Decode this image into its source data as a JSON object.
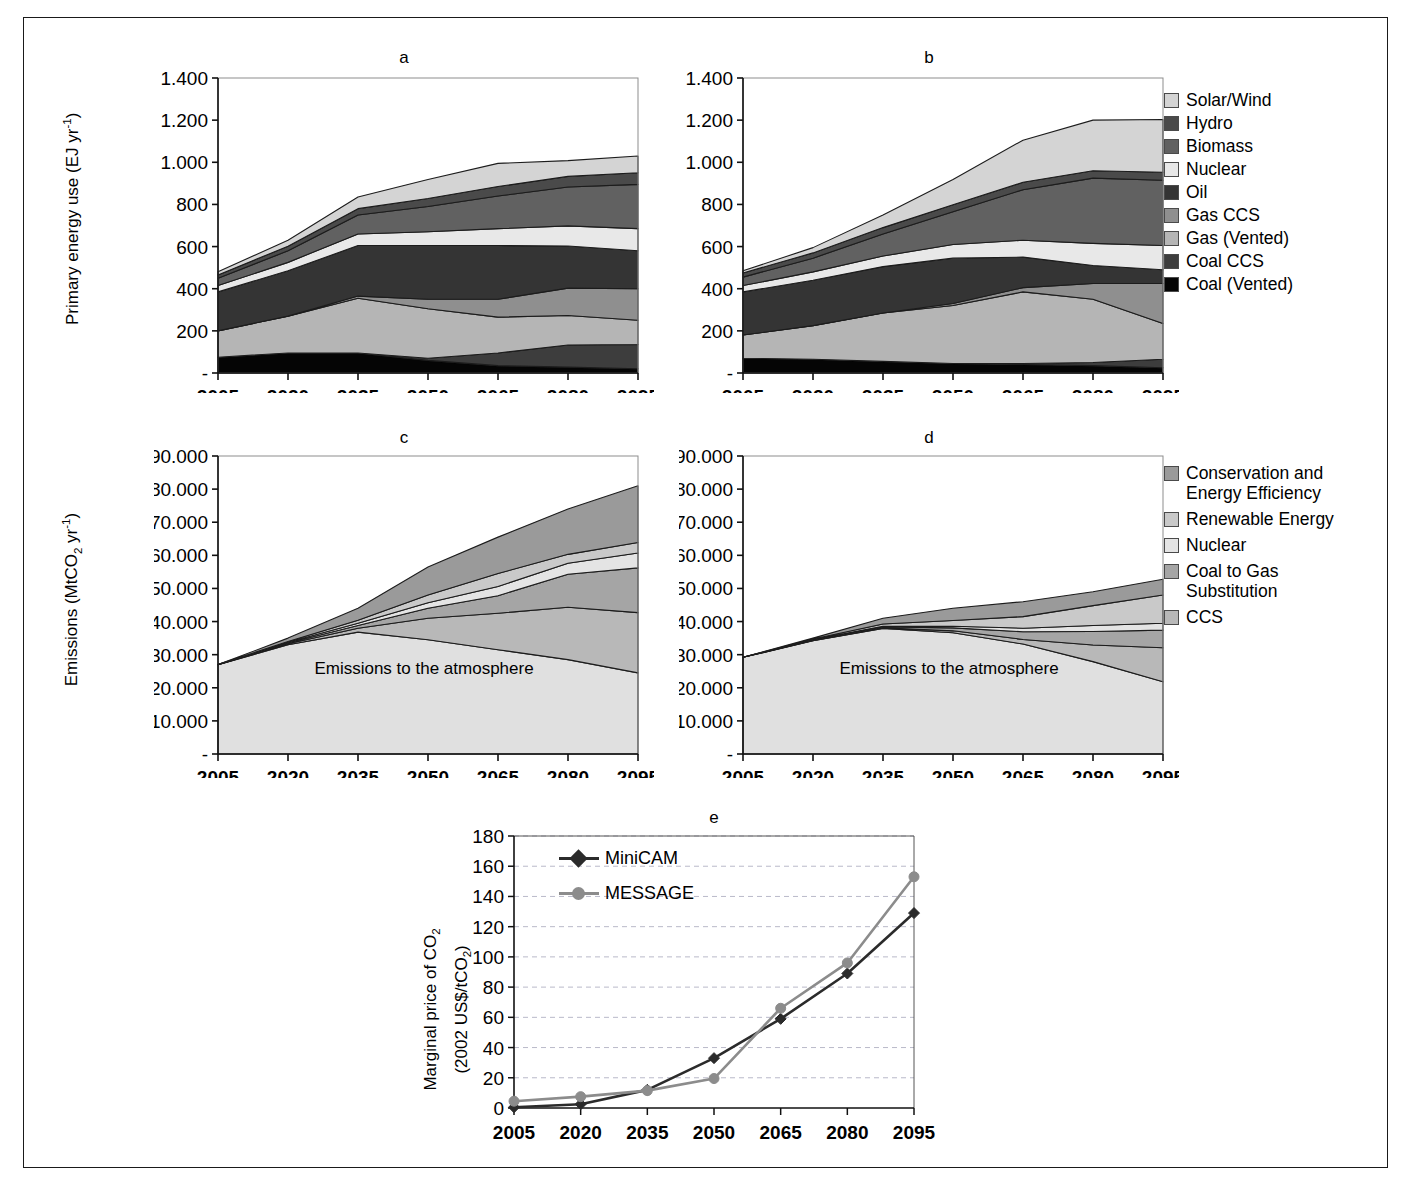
{
  "figure": {
    "panels": [
      "a",
      "b",
      "c",
      "d",
      "e"
    ],
    "models": {
      "minicam": "MiniCAM",
      "message": "MESSAGE"
    },
    "inplot_note": "Emissions to the\natmosphere"
  },
  "energy_legend": {
    "title": "",
    "items": [
      {
        "label": "Solar/Wind",
        "color": "#d4d4d4"
      },
      {
        "label": "Hydro",
        "color": "#4a4a4a"
      },
      {
        "label": "Biomass",
        "color": "#616161"
      },
      {
        "label": "Nuclear",
        "color": "#e8e8e8"
      },
      {
        "label": "Oil",
        "color": "#343434"
      },
      {
        "label": "Gas CCS",
        "color": "#8f8f8f"
      },
      {
        "label": "Gas (Vented)",
        "color": "#b5b5b5"
      },
      {
        "label": "Coal CCS",
        "color": "#3d3d3d"
      },
      {
        "label": "Coal (Vented)",
        "color": "#050505"
      }
    ]
  },
  "wedge_legend": {
    "items": [
      {
        "label": "Conservation and\nEnergy Efficiency",
        "color": "#9a9a9a"
      },
      {
        "label": "Renewable Energy",
        "color": "#c9c9c9"
      },
      {
        "label": "Nuclear",
        "color": "#e4e4e4"
      },
      {
        "label": "Coal to Gas\nSubstitution",
        "color": "#a5a5a5"
      },
      {
        "label": "CCS",
        "color": "#b8b8b8"
      }
    ]
  },
  "chart_data": [
    {
      "id": "a",
      "type": "area",
      "title": "a",
      "model": "MiniCAM",
      "xlabel": "",
      "ylabel": "Primary energy use (EJ yr-1)",
      "ylabel_html": "Primary energy use (EJ yr<sup>-1</sup>)",
      "categories": [
        2005,
        2020,
        2035,
        2050,
        2065,
        2080,
        2095
      ],
      "x": [
        2005,
        2020,
        2035,
        2050,
        2065,
        2080,
        2095
      ],
      "ylim": [
        0,
        1400
      ],
      "ytick_labels": [
        "1.400",
        "1.200",
        "1.000",
        "800",
        "600",
        "400",
        "200",
        "-"
      ],
      "yticks": [
        1400,
        1200,
        1000,
        800,
        600,
        400,
        200,
        0
      ],
      "xtick_labels": [
        "2005",
        "2020",
        "2035",
        "2050",
        "2065",
        "2080",
        "2095"
      ],
      "grid": false,
      "stack_order_bottom_to_top": [
        "Coal (Vented)",
        "Coal CCS",
        "Gas (Vented)",
        "Gas CCS",
        "Oil",
        "Nuclear",
        "Biomass",
        "Hydro",
        "Solar/Wind"
      ],
      "series": [
        {
          "name": "Coal (Vented)",
          "color": "#050505",
          "values": [
            75,
            95,
            95,
            60,
            35,
            28,
            20
          ]
        },
        {
          "name": "Coal CCS",
          "color": "#3d3d3d",
          "values": [
            0,
            0,
            0,
            10,
            60,
            105,
            115
          ]
        },
        {
          "name": "Gas (Vented)",
          "color": "#b5b5b5",
          "values": [
            125,
            175,
            260,
            235,
            170,
            140,
            115
          ]
        },
        {
          "name": "Gas CCS",
          "color": "#8f8f8f",
          "values": [
            0,
            0,
            10,
            45,
            85,
            130,
            150
          ]
        },
        {
          "name": "Oil",
          "color": "#343434",
          "values": [
            185,
            215,
            240,
            255,
            255,
            200,
            180
          ]
        },
        {
          "name": "Nuclear",
          "color": "#e8e8e8",
          "values": [
            30,
            40,
            55,
            65,
            80,
            95,
            105
          ]
        },
        {
          "name": "Biomass",
          "color": "#616161",
          "values": [
            35,
            55,
            90,
            120,
            155,
            185,
            210
          ]
        },
        {
          "name": "Hydro",
          "color": "#4a4a4a",
          "values": [
            15,
            22,
            30,
            38,
            45,
            50,
            55
          ]
        },
        {
          "name": "Solar/Wind",
          "color": "#d4d4d4",
          "values": [
            15,
            28,
            55,
            90,
            110,
            75,
            80
          ]
        }
      ],
      "totals": [
        480,
        630,
        835,
        918,
        995,
        1008,
        1030
      ]
    },
    {
      "id": "b",
      "type": "area",
      "title": "b",
      "model": "MESSAGE",
      "xlabel": "",
      "ylabel": "",
      "categories": [
        2005,
        2020,
        2035,
        2050,
        2065,
        2080,
        2095
      ],
      "x": [
        2005,
        2020,
        2035,
        2050,
        2065,
        2080,
        2095
      ],
      "ylim": [
        0,
        1400
      ],
      "ytick_labels": [
        "1.400",
        "1.200",
        "1.000",
        "800",
        "600",
        "400",
        "200",
        "-"
      ],
      "yticks": [
        1400,
        1200,
        1000,
        800,
        600,
        400,
        200,
        0
      ],
      "xtick_labels": [
        "2005",
        "2020",
        "2035",
        "2050",
        "2065",
        "2080",
        "2095"
      ],
      "grid": false,
      "stack_order_bottom_to_top": [
        "Coal (Vented)",
        "Coal CCS",
        "Gas (Vented)",
        "Gas CCS",
        "Oil",
        "Nuclear",
        "Biomass",
        "Hydro",
        "Solar/Wind"
      ],
      "series": [
        {
          "name": "Coal (Vented)",
          "color": "#050505",
          "values": [
            70,
            65,
            55,
            45,
            40,
            35,
            25
          ]
        },
        {
          "name": "Coal CCS",
          "color": "#3d3d3d",
          "values": [
            0,
            0,
            0,
            0,
            5,
            15,
            40
          ]
        },
        {
          "name": "Gas (Vented)",
          "color": "#b5b5b5",
          "values": [
            110,
            160,
            230,
            275,
            340,
            300,
            170
          ]
        },
        {
          "name": "Gas CCS",
          "color": "#8f8f8f",
          "values": [
            0,
            0,
            0,
            10,
            20,
            75,
            190
          ]
        },
        {
          "name": "Oil",
          "color": "#343434",
          "values": [
            205,
            215,
            220,
            215,
            145,
            85,
            65
          ]
        },
        {
          "name": "Nuclear",
          "color": "#e8e8e8",
          "values": [
            30,
            40,
            50,
            65,
            80,
            105,
            115
          ]
        },
        {
          "name": "Biomass",
          "color": "#616161",
          "values": [
            40,
            65,
            105,
            155,
            240,
            310,
            310
          ]
        },
        {
          "name": "Hydro",
          "color": "#4a4a4a",
          "values": [
            20,
            25,
            30,
            33,
            35,
            35,
            38
          ]
        },
        {
          "name": "Solar/Wind",
          "color": "#d4d4d4",
          "values": [
            10,
            25,
            60,
            120,
            200,
            240,
            250
          ]
        }
      ],
      "totals": [
        485,
        595,
        750,
        918,
        1105,
        1200,
        1203
      ]
    },
    {
      "id": "c",
      "type": "area",
      "title": "c",
      "model": "MiniCAM",
      "xlabel": "",
      "ylabel": "Emissions (MtCO2 yr-1)",
      "ylabel_html": "Emissions (MtCO<sub>2</sub> yr<sup>-1</sup>)",
      "categories": [
        2005,
        2020,
        2035,
        2050,
        2065,
        2080,
        2095
      ],
      "x": [
        2005,
        2020,
        2035,
        2050,
        2065,
        2080,
        2095
      ],
      "ylim": [
        0,
        90000
      ],
      "ytick_labels": [
        "90.000",
        "80.000",
        "70.000",
        "60.000",
        "50.000",
        "40.000",
        "30.000",
        "20.000",
        "10.000",
        "-"
      ],
      "yticks": [
        90000,
        80000,
        70000,
        60000,
        50000,
        40000,
        30000,
        20000,
        10000,
        0
      ],
      "xtick_labels": [
        "2005",
        "2020",
        "2035",
        "2050",
        "2065",
        "2080",
        "2095"
      ],
      "grid": false,
      "stack_order_bottom_to_top": [
        "Emissions to the atmosphere",
        "CCS",
        "Coal to Gas Substitution",
        "Nuclear",
        "Renewable Energy",
        "Conservation and Energy Efficiency"
      ],
      "series": [
        {
          "name": "Emissions to the atmosphere",
          "color": "#e0e0e0",
          "values": [
            27000,
            33000,
            36800,
            34500,
            31500,
            28500,
            24500
          ]
        },
        {
          "name": "CCS",
          "color": "#b8b8b8",
          "values": [
            0,
            300,
            1200,
            6500,
            11000,
            15800,
            18200
          ]
        },
        {
          "name": "Coal to Gas Substitution",
          "color": "#a5a5a5",
          "values": [
            0,
            250,
            800,
            3000,
            5300,
            10000,
            13500
          ]
        },
        {
          "name": "Nuclear",
          "color": "#e4e4e4",
          "values": [
            0,
            200,
            700,
            1700,
            2800,
            3300,
            4500
          ]
        },
        {
          "name": "Renewable Energy",
          "color": "#c9c9c9",
          "values": [
            0,
            250,
            900,
            2300,
            3900,
            2700,
            3200
          ]
        },
        {
          "name": "Conservation and Energy Efficiency",
          "color": "#9a9a9a",
          "values": [
            0,
            1000,
            3600,
            8500,
            11000,
            13700,
            17100
          ]
        }
      ],
      "totals": [
        27000,
        35000,
        44000,
        56500,
        65500,
        74000,
        81000
      ],
      "annotation": "Emissions to the atmosphere"
    },
    {
      "id": "d",
      "type": "area",
      "title": "d",
      "model": "MESSAGE",
      "xlabel": "",
      "ylabel": "",
      "categories": [
        2005,
        2020,
        2035,
        2050,
        2065,
        2080,
        2095
      ],
      "x": [
        2005,
        2020,
        2035,
        2050,
        2065,
        2080,
        2095
      ],
      "ylim": [
        0,
        90000
      ],
      "ytick_labels": [
        "90.000",
        "80.000",
        "70.000",
        "60.000",
        "50.000",
        "40.000",
        "30.000",
        "20.000",
        "10.000",
        "-"
      ],
      "yticks": [
        90000,
        80000,
        70000,
        60000,
        50000,
        40000,
        30000,
        20000,
        10000,
        0
      ],
      "xtick_labels": [
        "2005",
        "2020",
        "2035",
        "2050",
        "2065",
        "2080",
        "2095"
      ],
      "grid": false,
      "stack_order_bottom_to_top": [
        "Emissions to the atmosphere",
        "CCS",
        "Coal to Gas Substitution",
        "Nuclear",
        "Renewable Energy",
        "Conservation and Energy Efficiency"
      ],
      "series": [
        {
          "name": "Emissions to the atmosphere",
          "color": "#e0e0e0",
          "values": [
            29200,
            34200,
            37900,
            36600,
            33200,
            27900,
            21800
          ]
        },
        {
          "name": "CCS",
          "color": "#b8b8b8",
          "values": [
            0,
            100,
            200,
            600,
            1400,
            5000,
            10300
          ]
        },
        {
          "name": "Coal to Gas Substitution",
          "color": "#a5a5a5",
          "values": [
            0,
            150,
            250,
            900,
            2300,
            4100,
            5300
          ]
        },
        {
          "name": "Nuclear",
          "color": "#e4e4e4",
          "values": [
            0,
            100,
            200,
            500,
            1100,
            1800,
            2100
          ]
        },
        {
          "name": "Renewable Energy",
          "color": "#c9c9c9",
          "values": [
            0,
            200,
            700,
            1700,
            3500,
            6000,
            8500
          ]
        },
        {
          "name": "Conservation and Energy Efficiency",
          "color": "#9a9a9a",
          "values": [
            0,
            250,
            1750,
            3700,
            4500,
            4200,
            4800
          ]
        }
      ],
      "totals": [
        29200,
        35000,
        41000,
        44000,
        46000,
        49000,
        52800
      ],
      "annotation": "Emissions to the atmosphere"
    },
    {
      "id": "e",
      "type": "line",
      "title": "e",
      "xlabel": "",
      "ylabel": "Marginal price of CO2 (2002 US$/tCO2)",
      "ylabel_html_line1": "Marginal price of CO<sub>2</sub>",
      "ylabel_html_line2": "(2002 US$/tCO<sub>2</sub>)",
      "categories": [
        2005,
        2020,
        2035,
        2050,
        2065,
        2080,
        2095
      ],
      "x": [
        2005,
        2020,
        2035,
        2050,
        2065,
        2080,
        2095
      ],
      "ylim": [
        0,
        180
      ],
      "yticks": [
        0,
        20,
        40,
        60,
        80,
        100,
        120,
        140,
        160,
        180
      ],
      "ytick_labels": [
        "0",
        "20",
        "40",
        "60",
        "80",
        "100",
        "120",
        "140",
        "160",
        "180"
      ],
      "xtick_labels": [
        "2005",
        "2020",
        "2035",
        "2050",
        "2065",
        "2080",
        "2095"
      ],
      "grid": true,
      "legend_position": "top-left-inside",
      "series": [
        {
          "name": "MiniCAM",
          "color": "#2b2b2b",
          "marker": "diamond",
          "values": [
            0.5,
            2.5,
            12,
            33,
            59,
            89,
            129
          ]
        },
        {
          "name": "MESSAGE",
          "color": "#8c8c8c",
          "marker": "circle",
          "values": [
            4.5,
            7.5,
            11.5,
            19.5,
            66,
            96,
            153
          ]
        }
      ]
    }
  ]
}
